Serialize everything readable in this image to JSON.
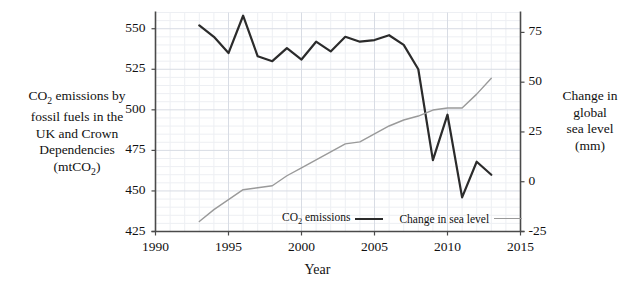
{
  "chart_data": {
    "type": "line",
    "title": "",
    "xlabel": "Year",
    "xlim": [
      1990,
      2015
    ],
    "xticks": [
      1990,
      1995,
      2000,
      2005,
      2010,
      2015
    ],
    "grid": true,
    "legend_position": "inside-bottom-center",
    "axes": [
      {
        "id": "left",
        "label": "CO2 emissions by fossil fuels in the UK and Crown Dependencies (mtCO2)",
        "label_lines": [
          "CO2 emissions by",
          "fossil fuels in the",
          "UK and Crown",
          "Dependencies",
          "(mtCO2)"
        ],
        "ylim": [
          425,
          560
        ],
        "yticks": [
          425,
          450,
          475,
          500,
          525,
          550
        ],
        "unit": "mtCO2"
      },
      {
        "id": "right",
        "label": "Change in global sea level (mm)",
        "label_lines": [
          "Change in",
          "global",
          "sea level",
          "(mm)"
        ],
        "ylim": [
          -25,
          85
        ],
        "yticks": [
          -25,
          0,
          25,
          50,
          75
        ],
        "unit": "mm"
      }
    ],
    "series": [
      {
        "name": "CO2 emissions",
        "legend_label": "CO2 emissions",
        "axis": "left",
        "color": "#2b2b2b",
        "line_width": 2.2,
        "x": [
          1993,
          1994,
          1995,
          1996,
          1997,
          1998,
          1999,
          2000,
          2001,
          2002,
          2003,
          2004,
          2005,
          2006,
          2007,
          2008,
          2009,
          2010,
          2011,
          2012,
          2013
        ],
        "values": [
          552,
          545,
          535,
          558,
          533,
          530,
          538,
          531,
          542,
          536,
          545,
          542,
          543,
          546,
          540,
          525,
          469,
          497,
          446,
          468,
          460
        ]
      },
      {
        "name": "Change in sea level",
        "legend_label": "Change in sea level",
        "axis": "right",
        "color": "#9a9a9a",
        "line_width": 1.4,
        "x": [
          1993,
          1994,
          1995,
          1996,
          1997,
          1998,
          1999,
          2000,
          2001,
          2002,
          2003,
          2004,
          2005,
          2006,
          2007,
          2008,
          2009,
          2010,
          2011,
          2012,
          2013
        ],
        "values": [
          -20,
          -14,
          -9,
          -4,
          -3,
          -2,
          3,
          7,
          11,
          15,
          19,
          20,
          24,
          28,
          31,
          33,
          36,
          37,
          37,
          44,
          52
        ]
      }
    ]
  },
  "axis_labels": {
    "left_line1": "CO",
    "left_sub1": "2",
    "left_line1b": " emissions by",
    "left_line2": "fossil fuels in the",
    "left_line3": "UK and Crown",
    "left_line4": "Dependencies",
    "left_line5a": "(mtCO",
    "left_sub2": "2",
    "left_line5b": ")",
    "right_line1": "Change in",
    "right_line2": "global",
    "right_line3": "sea level",
    "right_line4": "(mm)",
    "x_title": "Year"
  },
  "legend": {
    "co2_a": "CO",
    "co2_sub": "2",
    "co2_b": " emissions",
    "sea": "Change in sea level"
  },
  "ticks": {
    "left": [
      "550",
      "525",
      "500",
      "475",
      "450",
      "425"
    ],
    "right": [
      "75",
      "50",
      "25",
      "0",
      "-25"
    ],
    "x": [
      "1990",
      "1995",
      "2000",
      "2005",
      "2010",
      "2015"
    ]
  },
  "colors": {
    "co2_line": "#2b2b2b",
    "sea_line": "#9a9a9a",
    "axis": "#4a4a4a",
    "grid_major": "#d8dce4",
    "grid_minor": "#edeff3",
    "text": "#111111"
  }
}
